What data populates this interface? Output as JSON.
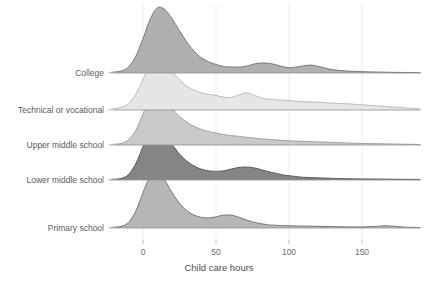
{
  "chart_data": {
    "type": "area",
    "subtype": "ridgeline",
    "title": "",
    "xlabel": "Child care hours",
    "ylabel": "",
    "xlim": [
      -25,
      195
    ],
    "xticks": [
      0,
      50,
      100,
      150
    ],
    "xtick_labels": [
      "0",
      "50",
      "100",
      "150"
    ],
    "grid": "vertical-only",
    "legend": "none",
    "categories": [
      "College",
      "Technical or vocational",
      "Upper middle school",
      "Lower middle school",
      "Primary school"
    ],
    "series": [
      {
        "name": "College",
        "fill_color": "#b0b0b0",
        "line_color": "#6e6e6e",
        "baseline_y": 73,
        "peak_x": 11,
        "peak_density": 1.0,
        "x": [
          -22,
          -15,
          -10,
          -5,
          0,
          5,
          10,
          15,
          20,
          25,
          30,
          35,
          40,
          45,
          50,
          55,
          60,
          65,
          70,
          75,
          80,
          85,
          90,
          95,
          100,
          105,
          110,
          115,
          120,
          130,
          140,
          150,
          160,
          170,
          180,
          190
        ],
        "y": [
          0.01,
          0.03,
          0.09,
          0.25,
          0.52,
          0.82,
          0.99,
          0.96,
          0.82,
          0.64,
          0.47,
          0.33,
          0.23,
          0.17,
          0.13,
          0.1,
          0.09,
          0.09,
          0.1,
          0.13,
          0.15,
          0.15,
          0.13,
          0.1,
          0.08,
          0.09,
          0.11,
          0.12,
          0.1,
          0.05,
          0.03,
          0.02,
          0.015,
          0.01,
          0.008,
          0.005
        ]
      },
      {
        "name": "Technical or vocational",
        "fill_color": "#e6e6e6",
        "line_color": "#b5b5b5",
        "baseline_y": 110,
        "peak_x": 9,
        "peak_density": 1.0,
        "x": [
          -22,
          -15,
          -10,
          -5,
          0,
          5,
          10,
          15,
          20,
          25,
          30,
          35,
          40,
          45,
          50,
          55,
          60,
          65,
          70,
          75,
          80,
          85,
          90,
          95,
          100,
          110,
          120,
          130,
          140,
          150,
          160,
          170,
          180,
          190
        ],
        "y": [
          0.02,
          0.05,
          0.12,
          0.3,
          0.58,
          0.88,
          1.0,
          0.92,
          0.74,
          0.58,
          0.46,
          0.38,
          0.33,
          0.3,
          0.28,
          0.25,
          0.24,
          0.28,
          0.33,
          0.3,
          0.24,
          0.21,
          0.2,
          0.19,
          0.18,
          0.16,
          0.15,
          0.13,
          0.12,
          0.1,
          0.08,
          0.06,
          0.04,
          0.02
        ]
      },
      {
        "name": "Upper middle school",
        "fill_color": "#c9c9c9",
        "line_color": "#9a9a9a",
        "baseline_y": 145,
        "peak_x": 9,
        "peak_density": 1.0,
        "x": [
          -22,
          -15,
          -10,
          -5,
          0,
          5,
          10,
          15,
          20,
          25,
          30,
          35,
          40,
          45,
          50,
          55,
          60,
          65,
          70,
          75,
          80,
          85,
          90,
          100,
          110,
          120,
          130,
          140,
          150,
          160,
          170,
          180,
          190
        ],
        "y": [
          0.01,
          0.03,
          0.1,
          0.28,
          0.6,
          0.9,
          1.0,
          0.88,
          0.7,
          0.55,
          0.44,
          0.36,
          0.3,
          0.26,
          0.23,
          0.2,
          0.18,
          0.17,
          0.15,
          0.14,
          0.12,
          0.11,
          0.1,
          0.08,
          0.07,
          0.06,
          0.05,
          0.04,
          0.03,
          0.025,
          0.02,
          0.015,
          0.01
        ]
      },
      {
        "name": "Lower middle school",
        "fill_color": "#858585",
        "line_color": "#525252",
        "baseline_y": 180,
        "peak_x": 9,
        "peak_density": 1.0,
        "x": [
          -22,
          -15,
          -10,
          -5,
          0,
          5,
          10,
          15,
          20,
          25,
          30,
          35,
          40,
          45,
          50,
          55,
          60,
          65,
          70,
          75,
          80,
          85,
          90,
          95,
          100,
          110,
          120,
          130,
          140,
          150,
          160,
          170,
          180,
          190
        ],
        "y": [
          0.01,
          0.03,
          0.1,
          0.3,
          0.62,
          0.92,
          1.0,
          0.86,
          0.66,
          0.48,
          0.35,
          0.26,
          0.2,
          0.17,
          0.16,
          0.17,
          0.2,
          0.23,
          0.24,
          0.23,
          0.2,
          0.16,
          0.13,
          0.1,
          0.08,
          0.05,
          0.04,
          0.03,
          0.025,
          0.02,
          0.018,
          0.015,
          0.012,
          0.01
        ]
      },
      {
        "name": "Primary school",
        "fill_color": "#b6b6b6",
        "line_color": "#6e6e6e",
        "baseline_y": 228,
        "peak_x": 8,
        "peak_density": 1.0,
        "x": [
          -22,
          -15,
          -10,
          -5,
          0,
          5,
          10,
          15,
          20,
          25,
          30,
          35,
          40,
          45,
          50,
          55,
          60,
          65,
          70,
          75,
          80,
          85,
          90,
          100,
          110,
          120,
          130,
          140,
          150,
          160,
          165,
          170,
          180,
          190
        ],
        "y": [
          0.01,
          0.03,
          0.1,
          0.3,
          0.63,
          0.93,
          1.0,
          0.85,
          0.63,
          0.44,
          0.31,
          0.23,
          0.19,
          0.18,
          0.2,
          0.23,
          0.23,
          0.2,
          0.15,
          0.11,
          0.08,
          0.06,
          0.05,
          0.04,
          0.035,
          0.03,
          0.025,
          0.02,
          0.02,
          0.03,
          0.04,
          0.035,
          0.015,
          0.008
        ]
      }
    ]
  },
  "axes": {
    "x_axis_title": "Child care hours",
    "tick_labels": [
      "0",
      "50",
      "100",
      "150"
    ]
  },
  "colors": {
    "background": "#ffffff",
    "gridline": "#ebebeb",
    "text": "#5a5a5a",
    "axis_title": "#4d4d4d"
  }
}
